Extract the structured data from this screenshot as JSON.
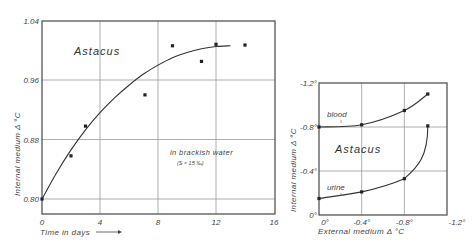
{
  "chart_data": [
    {
      "type": "scatter",
      "title": "Astacus",
      "annotation": "in brackish water",
      "annotation_sub": "(S ≈ 15 ‰)",
      "xlabel": "Time in days",
      "xlabel_arrow": "⟶",
      "ylabel": "Internal medium  Δ °C",
      "xlim": [
        0,
        16
      ],
      "ylim": [
        0.78,
        1.04
      ],
      "xticks": [
        "0",
        "4",
        "8",
        "12",
        "16"
      ],
      "yticks": [
        "0.80",
        "0.88",
        "0.96",
        "1.04"
      ],
      "grid": true,
      "series": [
        {
          "name": "measured",
          "x": [
            0,
            2,
            3,
            7.1,
            9,
            11,
            12,
            14
          ],
          "y": [
            0.8,
            0.858,
            0.898,
            0.94,
            1.006,
            0.985,
            1.008,
            1.007
          ]
        },
        {
          "name": "fitted curve",
          "x": [
            0,
            1,
            2,
            3,
            4,
            5,
            6,
            7,
            8,
            9,
            10,
            11,
            12,
            13
          ],
          "y": [
            0.8,
            0.835,
            0.866,
            0.893,
            0.916,
            0.936,
            0.953,
            0.968,
            0.98,
            0.99,
            0.997,
            1.002,
            1.005,
            1.006
          ]
        }
      ]
    },
    {
      "type": "line",
      "title": "Astacus",
      "xlabel": "External medium  Δ °C",
      "ylabel": "Internal medium  Δ °C",
      "xlim": [
        0,
        -1.2
      ],
      "ylim": [
        0,
        -1.2
      ],
      "xticks": [
        "0°",
        "-0.4°",
        "-0.8°",
        "-1.2°"
      ],
      "yticks": [
        "0°",
        "-0.4°",
        "-0.8°",
        "-1.2°"
      ],
      "grid": true,
      "series": [
        {
          "name": "blood",
          "x": [
            0,
            -0.4,
            -0.8,
            -1.02
          ],
          "y": [
            -0.8,
            -0.82,
            -0.95,
            -1.1
          ]
        },
        {
          "name": "urine",
          "x": [
            0,
            -0.4,
            -0.8,
            -1.02
          ],
          "y": [
            -0.15,
            -0.21,
            -0.33,
            -0.81
          ]
        }
      ]
    }
  ]
}
